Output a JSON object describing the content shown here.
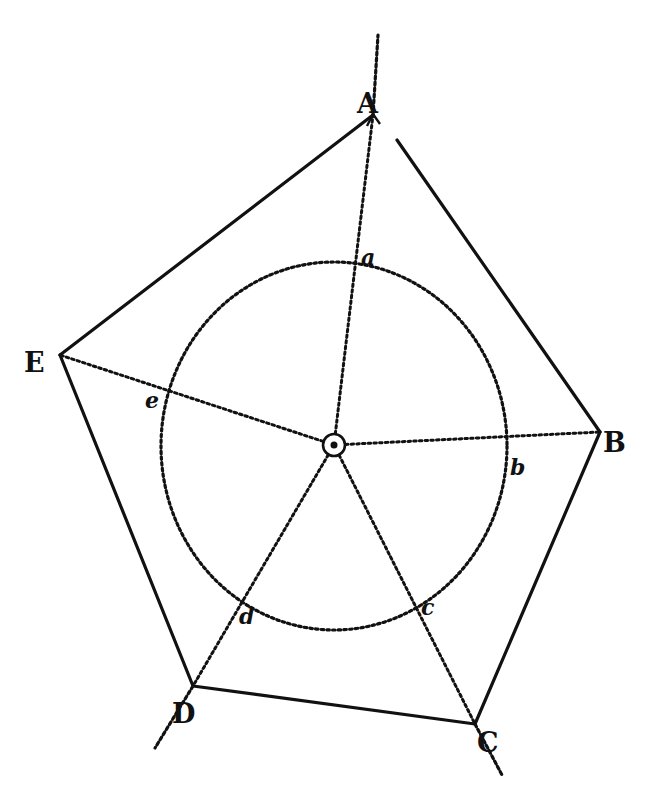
{
  "diagram": {
    "type": "geometric-construction",
    "colors": {
      "ink": "#111111",
      "paper": "#ffffff"
    },
    "center": {
      "x": 334,
      "y": 445,
      "label": ""
    },
    "circle": {
      "cx": 334,
      "cy": 446,
      "rx": 173,
      "ry": 184,
      "style": "dotted"
    },
    "vertices": [
      {
        "id": "A",
        "label": "A",
        "x": 373,
        "y": 115,
        "lx": 357,
        "ly": 103
      },
      {
        "id": "B",
        "label": "B",
        "x": 600,
        "y": 432,
        "lx": 603,
        "ly": 442
      },
      {
        "id": "C",
        "label": "C",
        "x": 475,
        "y": 724,
        "lx": 477,
        "ly": 742
      },
      {
        "id": "D",
        "label": "D",
        "x": 193,
        "y": 686,
        "lx": 172,
        "ly": 713
      },
      {
        "id": "E",
        "label": "E",
        "x": 60,
        "y": 355,
        "lx": 24,
        "ly": 362
      }
    ],
    "tangent_points": [
      {
        "id": "a",
        "label": "a",
        "x": 359,
        "y": 263,
        "lx": 361,
        "ly": 265
      },
      {
        "id": "b",
        "label": "b",
        "x": 506,
        "y": 440,
        "lx": 510,
        "ly": 475
      },
      {
        "id": "c",
        "label": "c",
        "x": 419,
        "y": 606,
        "lx": 421,
        "ly": 615
      },
      {
        "id": "d",
        "label": "d",
        "x": 245,
        "y": 603,
        "lx": 239,
        "ly": 624
      },
      {
        "id": "e",
        "label": "e",
        "x": 166,
        "y": 389,
        "lx": 145,
        "ly": 408
      }
    ],
    "extensions": [
      {
        "from": "A",
        "x1": 373,
        "y1": 115,
        "x2": 378,
        "y2": 35
      },
      {
        "from": "D",
        "x1": 193,
        "y1": 686,
        "x2": 155,
        "y2": 748
      },
      {
        "from": "C",
        "x1": 475,
        "y1": 724,
        "x2": 502,
        "y2": 775
      }
    ],
    "sides": [
      "A-B",
      "B-C",
      "C-D",
      "D-E",
      "E-A"
    ]
  }
}
